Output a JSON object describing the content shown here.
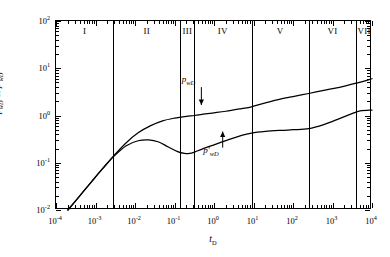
{
  "axes": {
    "x_title": "t",
    "x_title_sub": "D",
    "y_title_p": "p",
    "y_title_p_sub": "wD",
    "y_title_amp": " & ",
    "y_title_pd": "p'",
    "y_title_pd_sub": "wD",
    "xlim": [
      -4,
      4
    ],
    "ylim": [
      -2,
      2
    ],
    "xticks": [
      {
        "exp": "-4",
        "mant": "10"
      },
      {
        "exp": "-3",
        "mant": "10"
      },
      {
        "exp": "-2",
        "mant": "10"
      },
      {
        "exp": "-1",
        "mant": "10"
      },
      {
        "exp": "0",
        "mant": "10"
      },
      {
        "exp": "1",
        "mant": "10"
      },
      {
        "exp": "2",
        "mant": "10"
      },
      {
        "exp": "3",
        "mant": "10"
      },
      {
        "exp": "4",
        "mant": "10"
      }
    ],
    "yticks": [
      {
        "exp": "-2",
        "mant": "10"
      },
      {
        "exp": "-1",
        "mant": "10"
      },
      {
        "exp": "0",
        "mant": "10"
      },
      {
        "exp": "1",
        "mant": "10"
      },
      {
        "exp": "2",
        "mant": "10"
      }
    ]
  },
  "regions": [
    {
      "label": "I",
      "start": -4.0,
      "end": -2.55
    },
    {
      "label": "II",
      "start": -2.55,
      "end": -0.85
    },
    {
      "label": "III",
      "start": -0.85,
      "end": -0.5
    },
    {
      "label": "IV",
      "start": -0.5,
      "end": 0.95
    },
    {
      "label": "V",
      "start": 0.95,
      "end": 2.4
    },
    {
      "label": "VI",
      "start": 2.4,
      "end": 3.6
    },
    {
      "label": "VII",
      "start": 3.6,
      "end": 4.0
    }
  ],
  "annotations": [
    {
      "name": "pwd-annotation",
      "text": "p",
      "sub": "wD",
      "prime": "",
      "label_x": -0.62,
      "label_y": 0.72,
      "arrow_x": -0.32,
      "arrow_from_y": 0.6,
      "arrow_to_y": 0.22,
      "direction": "down"
    },
    {
      "name": "pwd-derivative-annotation",
      "text": "p",
      "sub": "wD",
      "prime": "'",
      "label_x": -0.05,
      "label_y": -0.78,
      "arrow_x": 0.22,
      "arrow_from_y": -0.68,
      "arrow_to_y": -0.34,
      "direction": "up"
    }
  ],
  "chart_data": {
    "type": "line",
    "title": "",
    "xlabel": "tD",
    "ylabel": "pwD & p'wD",
    "xscale": "log",
    "yscale": "log",
    "xlim": [
      0.0001,
      10000.0
    ],
    "ylim": [
      0.01,
      100
    ],
    "grid": false,
    "legend": "none",
    "region_boundaries_td": [
      0.003,
      0.14,
      0.32,
      8.9,
      250.0,
      4000.0
    ],
    "region_names": [
      "I",
      "II",
      "III",
      "IV",
      "V",
      "VI",
      "VII"
    ],
    "series": [
      {
        "name": "pwD",
        "label": "p_wD",
        "x": [
          0.0002,
          0.0004,
          0.0008,
          0.0015,
          0.003,
          0.006,
          0.012,
          0.025,
          0.05,
          0.1,
          0.2,
          0.32,
          0.6,
          1.0,
          2.0,
          5.0,
          8.9,
          20.0,
          50.0,
          100.0,
          250.0,
          600.0,
          1500.0,
          4000.0,
          10000.0
        ],
        "y": [
          0.01,
          0.02,
          0.04,
          0.075,
          0.145,
          0.265,
          0.43,
          0.61,
          0.77,
          0.88,
          0.96,
          1.0,
          1.08,
          1.14,
          1.23,
          1.4,
          1.53,
          1.85,
          2.25,
          2.52,
          2.92,
          3.4,
          3.95,
          4.85,
          6.0
        ]
      },
      {
        "name": "pwD_derivative",
        "label": "p'_wD",
        "x": [
          0.0002,
          0.0004,
          0.0008,
          0.0015,
          0.003,
          0.006,
          0.012,
          0.022,
          0.04,
          0.07,
          0.12,
          0.18,
          0.24,
          0.32,
          0.5,
          1.0,
          2.0,
          5.0,
          8.9,
          20.0,
          50.0,
          100.0,
          250.0,
          600.0,
          1500.0,
          3000.0,
          5000.0,
          10000.0
        ],
        "y": [
          0.01,
          0.02,
          0.04,
          0.074,
          0.14,
          0.23,
          0.292,
          0.305,
          0.275,
          0.215,
          0.172,
          0.157,
          0.157,
          0.168,
          0.195,
          0.24,
          0.295,
          0.38,
          0.425,
          0.46,
          0.485,
          0.5,
          0.525,
          0.64,
          0.86,
          1.08,
          1.25,
          1.3
        ]
      }
    ]
  }
}
